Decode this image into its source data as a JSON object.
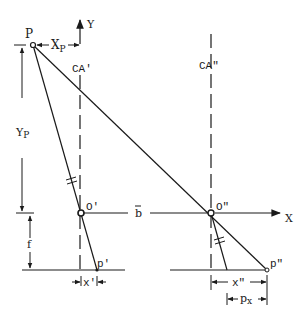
{
  "diagram": {
    "type": "stereo-parallax-geometry",
    "labels": {
      "point_p": "P",
      "x_p": "X",
      "x_p_sub": "P",
      "y_axis": "Y",
      "ca_left": "CA'",
      "ca_right": "CA\"",
      "y_p": "Y",
      "y_p_sub": "P",
      "o_left": "O'",
      "o_right": "O\"",
      "baseline": "b",
      "x_axis": "X",
      "focal": "f",
      "p_left": "p'",
      "p_right": "p\"",
      "x_left": "x'",
      "x_right": "x\"",
      "parallax": "p",
      "parallax_sub": "x"
    },
    "colors": {
      "ink": "#1a1a1a",
      "background": "#ffffff"
    }
  }
}
